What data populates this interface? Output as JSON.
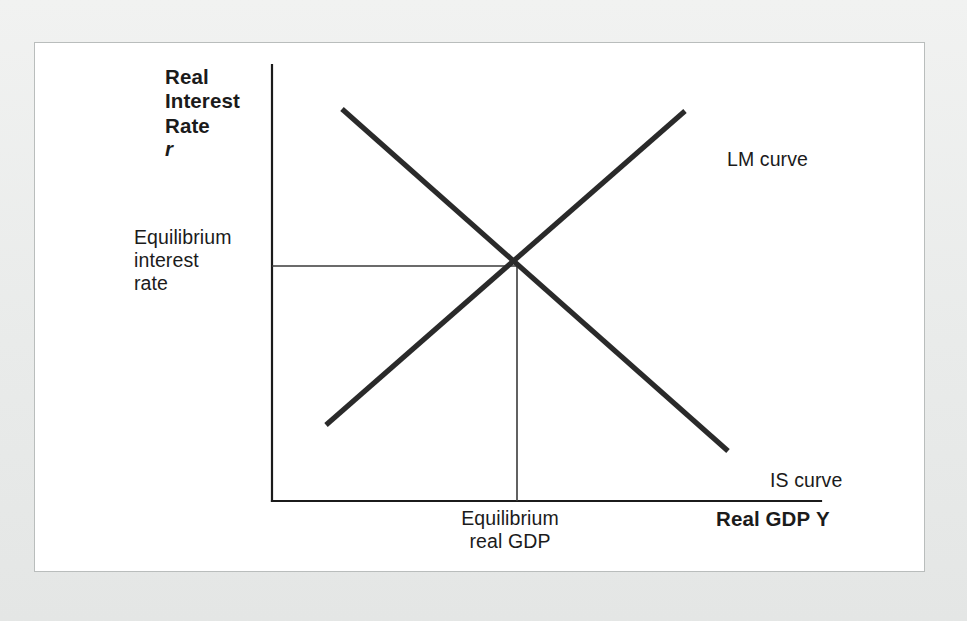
{
  "figure": {
    "kind": "is-lm-diagram",
    "background_color": "#eceeed",
    "panel_color": "#ffffff",
    "panel_border_color": "#b9bdbc",
    "axis_color": "#1b1b1b",
    "curve_color": "#2a2a2a",
    "guide_line_color": "#3a3a3a"
  },
  "labels": {
    "y_axis_title": "Real\nInterest\nRate",
    "y_axis_symbol": "r",
    "x_axis_title": "Real GDP",
    "x_axis_symbol": "Y",
    "equilibrium_rate": "Equilibrium\ninterest\nrate",
    "equilibrium_gdp": "Equilibrium\nreal GDP",
    "lm_curve": "LM curve",
    "is_curve": "IS curve"
  },
  "chart_data": {
    "type": "line",
    "title": "",
    "subtitle": "",
    "xlabel": "Real GDP Y",
    "ylabel": "Real Interest Rate r",
    "xlim": [
      0,
      100
    ],
    "ylim": [
      0,
      100
    ],
    "grid": false,
    "legend_position": "inline-end-of-line",
    "axes": {
      "y_axis": {
        "x_px": 271,
        "top_px": 64,
        "bottom_px": 500
      },
      "x_axis": {
        "y_px": 500,
        "left_px": 271,
        "right_px": 820
      }
    },
    "series": [
      {
        "name": "IS curve",
        "slope": "negative",
        "points_px": [
          [
            341,
            108
          ],
          [
            727,
            450
          ]
        ],
        "label": "IS curve",
        "label_anchor_px": [
          735,
          437
        ]
      },
      {
        "name": "LM curve",
        "slope": "positive",
        "points_px": [
          [
            325,
            424
          ],
          [
            684,
            110
          ]
        ],
        "label": "LM curve",
        "label_anchor_px": [
          692,
          116
        ]
      }
    ],
    "annotations": [
      {
        "name": "equilibrium-point",
        "point_px": [
          516,
          265
        ],
        "description": "Intersection of IS and LM curves"
      },
      {
        "name": "equilibrium-interest-rate-line",
        "from_px": [
          271,
          265
        ],
        "to_px": [
          516,
          265
        ],
        "orientation": "horizontal",
        "text": "Equilibrium interest rate"
      },
      {
        "name": "equilibrium-real-gdp-line",
        "from_px": [
          516,
          265
        ],
        "to_px": [
          516,
          500
        ],
        "orientation": "vertical",
        "text": "Equilibrium real GDP"
      }
    ]
  }
}
